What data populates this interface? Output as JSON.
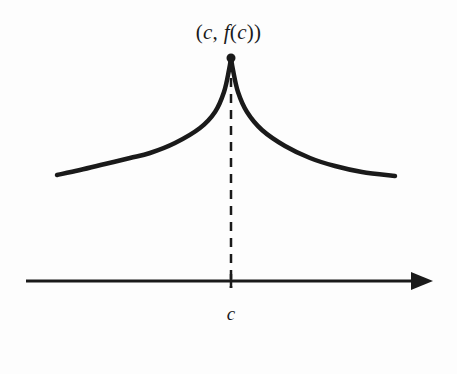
{
  "figure": {
    "background_color": "#fdfdfd",
    "ink_color": "#1a1a1a",
    "width": 457,
    "height": 374
  },
  "labels": {
    "point_label": {
      "full_text": "(c, f(c))",
      "open_paren": "(",
      "var_c": "c",
      "comma_space": ", ",
      "func_f": "f",
      "inner_open_paren": "(",
      "inner_var_c": "c",
      "inner_close_paren": ")",
      "close_paren": ")"
    },
    "axis_tick_label": {
      "text": "c"
    }
  },
  "chart_data": {
    "type": "line",
    "title": "",
    "xlabel": "",
    "ylabel": "",
    "grid": false,
    "legend": false,
    "axes": {
      "x_axis": {
        "start": [
          26,
          281
        ],
        "end": [
          433,
          281
        ],
        "arrow": "right",
        "stroke_width": 3
      },
      "tick_marks": [
        {
          "label": "c",
          "x": 231,
          "y": 281,
          "height": 14
        }
      ]
    },
    "annotations": [
      {
        "kind": "point-marker",
        "label": "(c, f(c))",
        "x": 231,
        "y": 58,
        "radius": 4.5,
        "filled": true
      },
      {
        "kind": "dashed-dropline",
        "from": [
          231,
          62
        ],
        "to": [
          231,
          288
        ],
        "dash": 9,
        "gap": 7,
        "stroke_width": 2.5
      }
    ],
    "series": [
      {
        "name": "f(x) left branch",
        "stroke_width": 4.5,
        "points": [
          [
            57,
            175
          ],
          [
            80,
            170
          ],
          [
            105,
            164
          ],
          [
            130,
            158
          ],
          [
            150,
            153
          ],
          [
            175,
            143
          ],
          [
            200,
            128
          ],
          [
            215,
            112
          ],
          [
            224,
            92
          ],
          [
            229,
            70
          ],
          [
            231,
            58
          ]
        ]
      },
      {
        "name": "f(x) right branch",
        "stroke_width": 4.5,
        "points": [
          [
            231,
            58
          ],
          [
            233,
            70
          ],
          [
            238,
            92
          ],
          [
            247,
            112
          ],
          [
            262,
            130
          ],
          [
            285,
            146
          ],
          [
            310,
            158
          ],
          [
            335,
            166
          ],
          [
            362,
            172
          ],
          [
            395,
            176
          ]
        ]
      }
    ]
  }
}
